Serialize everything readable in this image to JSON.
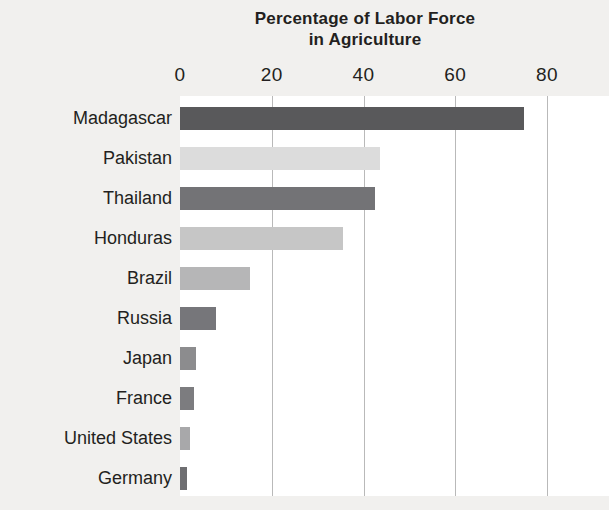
{
  "chart_data": {
    "type": "bar",
    "orientation": "horizontal",
    "title": "Percentage of Labor Force in Agriculture",
    "title_lines": [
      "Percentage of Labor Force",
      "in Agriculture"
    ],
    "xlabel": "",
    "ylabel": "",
    "xlim": [
      0,
      80
    ],
    "ylim": null,
    "xticks": [
      0,
      20,
      40,
      60,
      80
    ],
    "xtick_labels": [
      "0",
      "20",
      "40",
      "60",
      "80"
    ],
    "grid": "vertical",
    "legend": null,
    "categories": [
      "Madagascar",
      "Pakistan",
      "Thailand",
      "Honduras",
      "Brazil",
      "Russia",
      "Japan",
      "France",
      "United States",
      "Germany"
    ],
    "values": [
      75,
      43.5,
      42.5,
      35.5,
      15.3,
      7.8,
      3.5,
      3.0,
      2.2,
      1.6
    ],
    "bar_colors": [
      "#59595b",
      "#dcdcdc",
      "#737376",
      "#c6c6c6",
      "#b6b6b7",
      "#76767a",
      "#8c8c8e",
      "#7c7c7f",
      "#a8a8aa",
      "#6e6e71"
    ],
    "bars": [
      {
        "label": "Madagascar",
        "value": 75,
        "color": "#59595b"
      },
      {
        "label": "Pakistan",
        "value": 43.5,
        "color": "#dcdcdc"
      },
      {
        "label": "Thailand",
        "value": 42.5,
        "color": "#737376"
      },
      {
        "label": "Honduras",
        "value": 35.5,
        "color": "#c6c6c6"
      },
      {
        "label": "Brazil",
        "value": 15.3,
        "color": "#b6b6b7"
      },
      {
        "label": "Russia",
        "value": 7.8,
        "color": "#76767a"
      },
      {
        "label": "Japan",
        "value": 3.5,
        "color": "#8c8c8e"
      },
      {
        "label": "France",
        "value": 3.0,
        "color": "#7c7c7f"
      },
      {
        "label": "United States",
        "value": 2.2,
        "color": "#a8a8aa"
      },
      {
        "label": "Germany",
        "value": 1.6,
        "color": "#6e6e71"
      }
    ]
  },
  "style": {
    "page_background": "#f1f0ee",
    "plot_background": "#ffffff",
    "gridline_color": "#b9b9b9",
    "text_color": "#231f20"
  }
}
